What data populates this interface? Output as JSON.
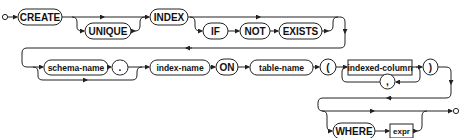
{
  "diagram": {
    "type": "railroad-syntax-diagram",
    "colors": {
      "line": "#222222",
      "background": "#ffffff",
      "text": "#111111"
    },
    "terminals": {
      "create": "CREATE",
      "unique": "UNIQUE",
      "index": "INDEX",
      "if": "IF",
      "not": "NOT",
      "exists": "EXISTS",
      "dot": ".",
      "on": "ON",
      "lparen": "(",
      "comma": ",",
      "rparen": ")",
      "where": "WHERE"
    },
    "nonterminals": {
      "schema_name": "schema-name",
      "index_name": "index-name",
      "table_name": "table-name",
      "indexed_column": "indexed-column",
      "expr": "expr"
    },
    "sequence": [
      "CREATE",
      "[UNIQUE]",
      "INDEX",
      "[IF NOT EXISTS]",
      "[schema-name .]",
      "index-name",
      "ON",
      "table-name",
      "(",
      "indexed-column {, indexed-column}",
      ")",
      "[WHERE expr]"
    ]
  }
}
